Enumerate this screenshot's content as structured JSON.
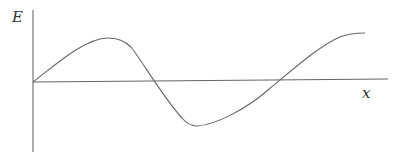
{
  "figure": {
    "y_label": "E",
    "x_label": "x",
    "line_color": "#666666",
    "curve_description": "wave starting at origin, rising to a maximum, falling through zero to a minimum, then rising back through zero to a second maximum"
  }
}
